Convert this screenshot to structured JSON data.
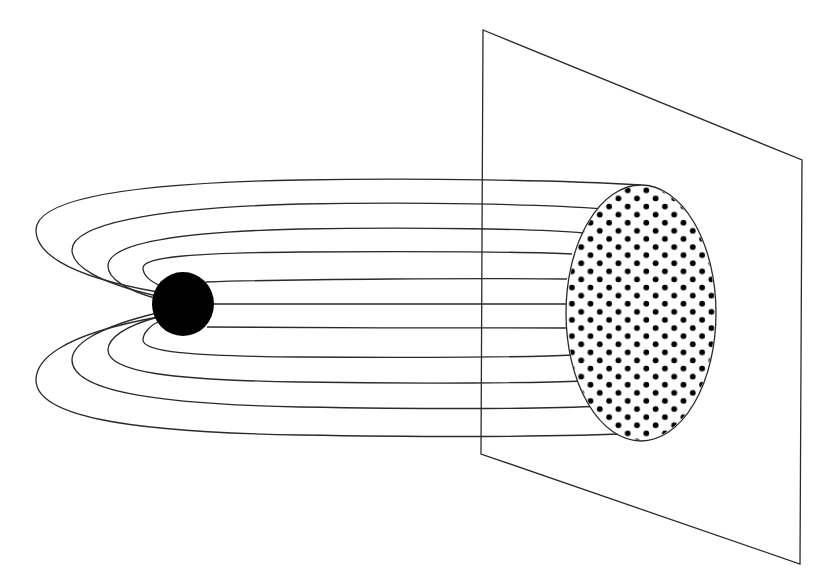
{
  "diagram": {
    "type": "field-lines-through-plane",
    "colors": {
      "line": "#2a2a2a",
      "fill": "#000000",
      "background": "#ffffff"
    },
    "source": {
      "name": "charged-sphere",
      "cx": 183,
      "cy": 304,
      "r": 31
    },
    "plane": {
      "points": "483,30 802,160 800,564 481,454"
    },
    "flux_area": {
      "cx": 641,
      "cy": 313,
      "rx": 75,
      "ry": 128,
      "dot_spacing": 9.3,
      "dot_r": 2.9
    },
    "field_line_count": 11
  }
}
